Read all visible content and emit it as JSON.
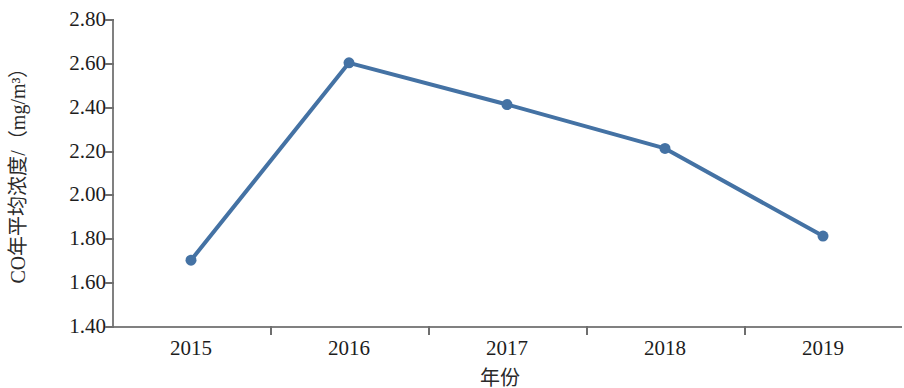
{
  "chart_data": {
    "type": "line",
    "title": "",
    "xlabel": "年份",
    "ylabel": "CO年平均浓度/（mg/m³）",
    "categories": [
      "2015",
      "2016",
      "2017",
      "2018",
      "2019"
    ],
    "values": [
      1.7,
      2.6,
      2.41,
      2.21,
      1.81
    ],
    "point_labels": [
      "1.70",
      "2.60",
      "2.41",
      "2.21",
      "1.81"
    ],
    "ylim": [
      1.4,
      2.8
    ],
    "ytick_labels": [
      "2.80",
      "2.60",
      "2.40",
      "2.20",
      "2.00",
      "1.80",
      "1.60",
      "1.40"
    ],
    "ytick_values": [
      2.8,
      2.6,
      2.4,
      2.2,
      2.0,
      1.8,
      1.6,
      1.4
    ],
    "ytick_step": 0.2,
    "grid": false,
    "legend": null,
    "legend_position": "none",
    "series": [
      {
        "name": "CO年平均浓度",
        "values": [
          1.7,
          2.6,
          2.41,
          2.21,
          1.81
        ],
        "color": "#4472A4",
        "marker": "circle",
        "marker_size": 11,
        "line_width": 4
      }
    ],
    "colors": {
      "series": "#4472A4",
      "axis": "#808080",
      "text": "#1d1d1d",
      "background": "#ffffff"
    }
  }
}
